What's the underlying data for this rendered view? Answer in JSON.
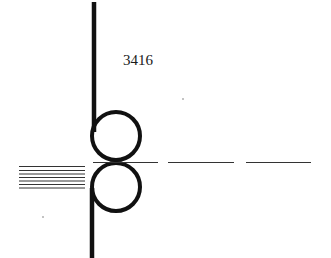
{
  "diagram": {
    "reference_label": "3416",
    "colors": {
      "stroke": "#111111",
      "thin_line": "#333333",
      "background": "#ffffff"
    }
  }
}
